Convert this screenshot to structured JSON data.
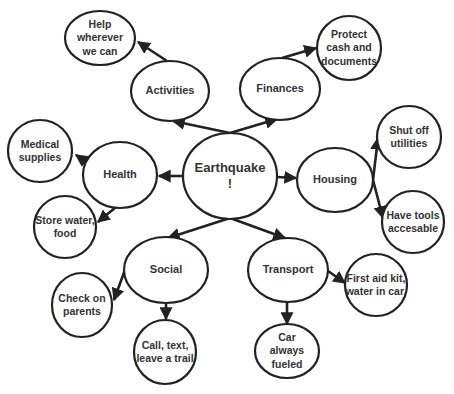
{
  "diagram": {
    "type": "mind-map",
    "center": {
      "id": "earthquake",
      "label": "Earthquake\n!"
    },
    "nodes": [
      {
        "id": "activities",
        "label": "Activities"
      },
      {
        "id": "finances",
        "label": "Finances"
      },
      {
        "id": "health",
        "label": "Health"
      },
      {
        "id": "housing",
        "label": "Housing"
      },
      {
        "id": "social",
        "label": "Social"
      },
      {
        "id": "transport",
        "label": "Transport"
      },
      {
        "id": "help",
        "label": "Help\nwherever\nwe can"
      },
      {
        "id": "protect",
        "label": "Protect\ncash and\ndocuments"
      },
      {
        "id": "medical",
        "label": "Medical\nsupplies"
      },
      {
        "id": "store",
        "label": "Store water,\nfood"
      },
      {
        "id": "shutoff",
        "label": "Shut off\nutilities"
      },
      {
        "id": "tools",
        "label": "Have tools\naccesable"
      },
      {
        "id": "check",
        "label": "Check on\nparents"
      },
      {
        "id": "call",
        "label": "Call, text,\nleave a trail"
      },
      {
        "id": "firstaid",
        "label": "First aid kit,\nwater in car."
      },
      {
        "id": "car",
        "label": "Car\nalways\nfueled"
      }
    ],
    "edges": [
      [
        "earthquake",
        "activities"
      ],
      [
        "earthquake",
        "finances"
      ],
      [
        "earthquake",
        "health"
      ],
      [
        "earthquake",
        "housing"
      ],
      [
        "earthquake",
        "social"
      ],
      [
        "earthquake",
        "transport"
      ],
      [
        "activities",
        "help"
      ],
      [
        "finances",
        "protect"
      ],
      [
        "health",
        "medical"
      ],
      [
        "health",
        "store"
      ],
      [
        "housing",
        "shutoff"
      ],
      [
        "housing",
        "tools"
      ],
      [
        "social",
        "check"
      ],
      [
        "social",
        "call"
      ],
      [
        "transport",
        "firstaid"
      ],
      [
        "transport",
        "car"
      ]
    ],
    "colors": {
      "stroke": "#222222",
      "text": "#333333",
      "background": "#ffffff"
    }
  }
}
